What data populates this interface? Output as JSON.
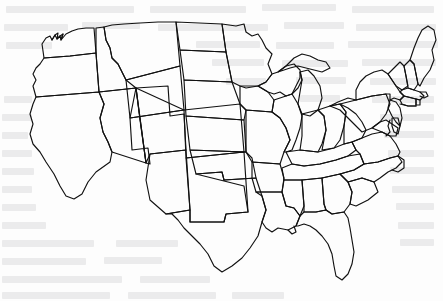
{
  "document": {
    "title": "United States Outline Map",
    "description": "Black-line outline map of the contiguous United States showing state boundaries, printed on a scanned page with faint text bleed-through from the reverse side.",
    "scan_artifact_label": "reverse-side text bleed-through",
    "width": 443,
    "height": 301
  },
  "colors": {
    "background": "#fdfdfd",
    "border_line": "#111111",
    "bleed_text": "#8e8e93"
  },
  "map": {
    "name": "contiguous-united-states",
    "region_label": "Contiguous United States",
    "state_count": 48,
    "outline_style": "black line, no fill, no labels",
    "states": [
      "Washington",
      "Oregon",
      "California",
      "Nevada",
      "Idaho",
      "Montana",
      "Wyoming",
      "Utah",
      "Arizona",
      "Colorado",
      "New Mexico",
      "North Dakota",
      "South Dakota",
      "Nebraska",
      "Kansas",
      "Oklahoma",
      "Texas",
      "Minnesota",
      "Iowa",
      "Missouri",
      "Arkansas",
      "Louisiana",
      "Wisconsin",
      "Illinois",
      "Michigan",
      "Indiana",
      "Ohio",
      "Kentucky",
      "Tennessee",
      "Mississippi",
      "Alabama",
      "Georgia",
      "Florida",
      "South Carolina",
      "North Carolina",
      "Virginia",
      "West Virginia",
      "Maryland",
      "Delaware",
      "New Jersey",
      "Pennsylvania",
      "New York",
      "Connecticut",
      "Rhode Island",
      "Massachusetts",
      "Vermont",
      "New Hampshire",
      "Maine"
    ]
  },
  "bleed_lines": [
    {
      "x": 6,
      "y": 6,
      "w": 128
    },
    {
      "x": 150,
      "y": 6,
      "w": 96
    },
    {
      "x": 262,
      "y": 4,
      "w": 74
    },
    {
      "x": 352,
      "y": 6,
      "w": 82
    },
    {
      "x": 4,
      "y": 24,
      "w": 64
    },
    {
      "x": 82,
      "y": 22,
      "w": 58
    },
    {
      "x": 158,
      "y": 24,
      "w": 110
    },
    {
      "x": 284,
      "y": 22,
      "w": 60
    },
    {
      "x": 356,
      "y": 24,
      "w": 80
    },
    {
      "x": 6,
      "y": 42,
      "w": 46
    },
    {
      "x": 196,
      "y": 41,
      "w": 64
    },
    {
      "x": 276,
      "y": 42,
      "w": 58
    },
    {
      "x": 348,
      "y": 41,
      "w": 90
    },
    {
      "x": 212,
      "y": 59,
      "w": 52
    },
    {
      "x": 282,
      "y": 60,
      "w": 66
    },
    {
      "x": 362,
      "y": 59,
      "w": 74
    },
    {
      "x": 226,
      "y": 78,
      "w": 40
    },
    {
      "x": 296,
      "y": 77,
      "w": 50
    },
    {
      "x": 370,
      "y": 78,
      "w": 66
    },
    {
      "x": 4,
      "y": 96,
      "w": 28
    },
    {
      "x": 300,
      "y": 95,
      "w": 40
    },
    {
      "x": 372,
      "y": 96,
      "w": 62
    },
    {
      "x": 2,
      "y": 114,
      "w": 30
    },
    {
      "x": 380,
      "y": 114,
      "w": 54
    },
    {
      "x": 2,
      "y": 132,
      "w": 26
    },
    {
      "x": 384,
      "y": 131,
      "w": 50
    },
    {
      "x": 2,
      "y": 150,
      "w": 30
    },
    {
      "x": 388,
      "y": 150,
      "w": 46
    },
    {
      "x": 2,
      "y": 168,
      "w": 32
    },
    {
      "x": 390,
      "y": 167,
      "w": 44
    },
    {
      "x": 2,
      "y": 186,
      "w": 30
    },
    {
      "x": 392,
      "y": 186,
      "w": 42
    },
    {
      "x": 2,
      "y": 204,
      "w": 34
    },
    {
      "x": 396,
      "y": 203,
      "w": 38
    },
    {
      "x": 2,
      "y": 222,
      "w": 44
    },
    {
      "x": 398,
      "y": 222,
      "w": 36
    },
    {
      "x": 2,
      "y": 240,
      "w": 92
    },
    {
      "x": 116,
      "y": 240,
      "w": 62
    },
    {
      "x": 400,
      "y": 239,
      "w": 34
    },
    {
      "x": 2,
      "y": 258,
      "w": 84
    },
    {
      "x": 104,
      "y": 257,
      "w": 58
    },
    {
      "x": 2,
      "y": 276,
      "w": 120
    },
    {
      "x": 140,
      "y": 276,
      "w": 70
    },
    {
      "x": 2,
      "y": 292,
      "w": 108
    },
    {
      "x": 128,
      "y": 292,
      "w": 88
    },
    {
      "x": 232,
      "y": 292,
      "w": 52
    }
  ]
}
